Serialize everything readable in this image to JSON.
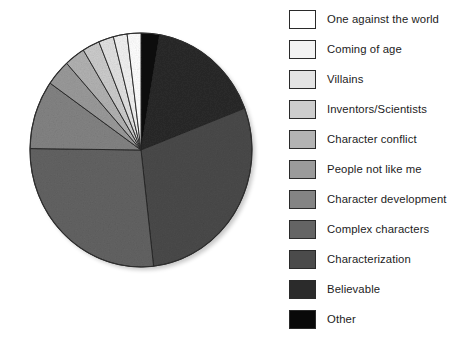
{
  "chart_data": {
    "type": "pie",
    "title": "",
    "legend_position": "right",
    "start_angle_deg": 0,
    "direction": "clockwise",
    "categories": [
      "One against the world",
      "Coming of age",
      "Villains",
      "Inventors/Scientists",
      "Character conflict",
      "People not like me",
      "Character development",
      "Complex characters",
      "Characterization",
      "Believable",
      "Other"
    ],
    "values": [
      2.0,
      2.0,
      2.2,
      2.5,
      3.0,
      3.6,
      9.5,
      27.0,
      29.0,
      16.5,
      2.7
    ],
    "units": "percent",
    "colors": [
      "#ffffff",
      "#f2f2f2",
      "#e2e2e2",
      "#cccccc",
      "#b2b2b2",
      "#9a9a9a",
      "#838383",
      "#636363",
      "#4a4a4a",
      "#2a2a2a",
      "#080808"
    ],
    "slices": [
      {
        "label": "Other",
        "value": 2.7,
        "color": "#080808",
        "start_deg": 0.0,
        "sweep_deg": 9.7
      },
      {
        "label": "Believable",
        "value": 16.5,
        "color": "#2a2a2a",
        "start_deg": 9.7,
        "sweep_deg": 59.4
      },
      {
        "label": "Characterization",
        "value": 29.0,
        "color": "#4a4a4a",
        "start_deg": 69.1,
        "sweep_deg": 104.4
      },
      {
        "label": "Complex characters",
        "value": 27.0,
        "color": "#636363",
        "start_deg": 173.5,
        "sweep_deg": 97.2
      },
      {
        "label": "Character development",
        "value": 9.5,
        "color": "#838383",
        "start_deg": 270.7,
        "sweep_deg": 34.2
      },
      {
        "label": "People not like me",
        "value": 3.6,
        "color": "#9a9a9a",
        "start_deg": 304.9,
        "sweep_deg": 13.0
      },
      {
        "label": "Character conflict",
        "value": 3.0,
        "color": "#b2b2b2",
        "start_deg": 317.9,
        "sweep_deg": 10.8
      },
      {
        "label": "Inventors/Scientists",
        "value": 2.5,
        "color": "#cccccc",
        "start_deg": 328.7,
        "sweep_deg": 9.0
      },
      {
        "label": "Villains",
        "value": 2.2,
        "color": "#e2e2e2",
        "start_deg": 337.7,
        "sweep_deg": 7.9
      },
      {
        "label": "Coming of age",
        "value": 2.0,
        "color": "#f2f2f2",
        "start_deg": 345.6,
        "sweep_deg": 7.2
      },
      {
        "label": "One against the world",
        "value": 2.0,
        "color": "#ffffff",
        "start_deg": 352.8,
        "sweep_deg": 7.2
      }
    ]
  },
  "legend": {
    "items": [
      {
        "label": "One against the world",
        "color": "#ffffff"
      },
      {
        "label": "Coming of age",
        "color": "#f3f3f3"
      },
      {
        "label": "Villains",
        "color": "#e4e4e4"
      },
      {
        "label": "Inventors/Scientists",
        "color": "#cdcdcd"
      },
      {
        "label": "Character conflict",
        "color": "#b3b3b3"
      },
      {
        "label": "People not like me",
        "color": "#9b9b9b"
      },
      {
        "label": "Character development",
        "color": "#848484"
      },
      {
        "label": "Complex characters",
        "color": "#646464"
      },
      {
        "label": "Characterization",
        "color": "#4b4b4b"
      },
      {
        "label": "Believable",
        "color": "#2b2b2b"
      },
      {
        "label": "Other",
        "color": "#090909"
      }
    ]
  }
}
